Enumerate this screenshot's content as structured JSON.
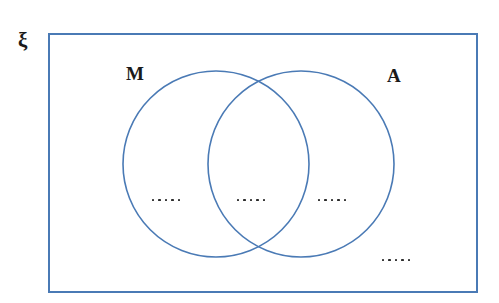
{
  "diagram": {
    "kind": "venn-diagram",
    "colors": {
      "stroke_blue": "#4a7ab5",
      "rectangle_blue": "#4a7ab5",
      "label_black": "#1a1a1a",
      "dot_black": "#2b2b2b",
      "background": "#ffffff"
    },
    "universal_set": {
      "label": "ξ",
      "name": "xi"
    },
    "sets": [
      {
        "id": "m",
        "label": "M"
      },
      {
        "id": "a",
        "label": "A"
      }
    ],
    "regions": [
      {
        "id": "m-only",
        "label": "·····",
        "dot_count": 5,
        "meaning": "M only"
      },
      {
        "id": "both",
        "label": "·····",
        "dot_count": 5,
        "meaning": "M and A"
      },
      {
        "id": "a-only",
        "label": "·····",
        "dot_count": 5,
        "meaning": "A only"
      },
      {
        "id": "neither",
        "label": "·····",
        "dot_count": 5,
        "meaning": "neither M nor A"
      }
    ],
    "geometry": {
      "rectangle": {
        "x": 48,
        "y": 33,
        "width": 430,
        "height": 260,
        "stroke_width": 2
      },
      "circle_m": {
        "cx": 216,
        "cy": 164,
        "r": 93,
        "stroke_width": 1.6
      },
      "circle_a": {
        "cx": 301,
        "cy": 164,
        "r": 93,
        "stroke_width": 1.6
      }
    }
  }
}
